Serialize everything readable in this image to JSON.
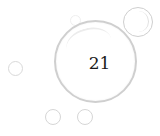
{
  "main_bubble": {
    "value": "21"
  },
  "decorative_bubbles": [
    {
      "name": "top-right-bubble"
    },
    {
      "name": "tiny-top-bubble"
    },
    {
      "name": "left-bubble"
    },
    {
      "name": "bottom-left-bubble"
    },
    {
      "name": "bottom-right-bubble"
    }
  ],
  "colors": {
    "bubble_border": "#cfcfcf",
    "text": "#1a1a1a",
    "background": "#ffffff"
  }
}
